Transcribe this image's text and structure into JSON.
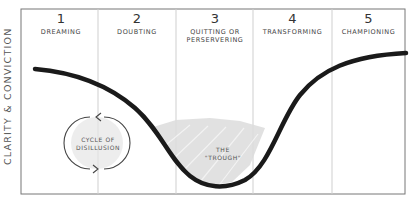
{
  "diagram": {
    "y_axis_label": "CLARITY & CONVICTION",
    "stages": [
      {
        "number": "1",
        "name": "DREAMING"
      },
      {
        "number": "2",
        "name": "DOUBTING"
      },
      {
        "number": "3",
        "name": "QUITTING OR PERSERVERING"
      },
      {
        "number": "4",
        "name": "TRANSFORMING"
      },
      {
        "number": "5",
        "name": "CHAMPIONING"
      }
    ],
    "annotations": {
      "cycle": {
        "line1": "CYCLE OF",
        "line2": "DISILLUSION"
      },
      "trough": {
        "line1": "THE",
        "line2": "\"TROUGH\""
      }
    },
    "colors": {
      "curve": "#1a1a1a",
      "frame": "#777777",
      "divider": "#cccccc",
      "shading": "#d9d9d9"
    }
  }
}
